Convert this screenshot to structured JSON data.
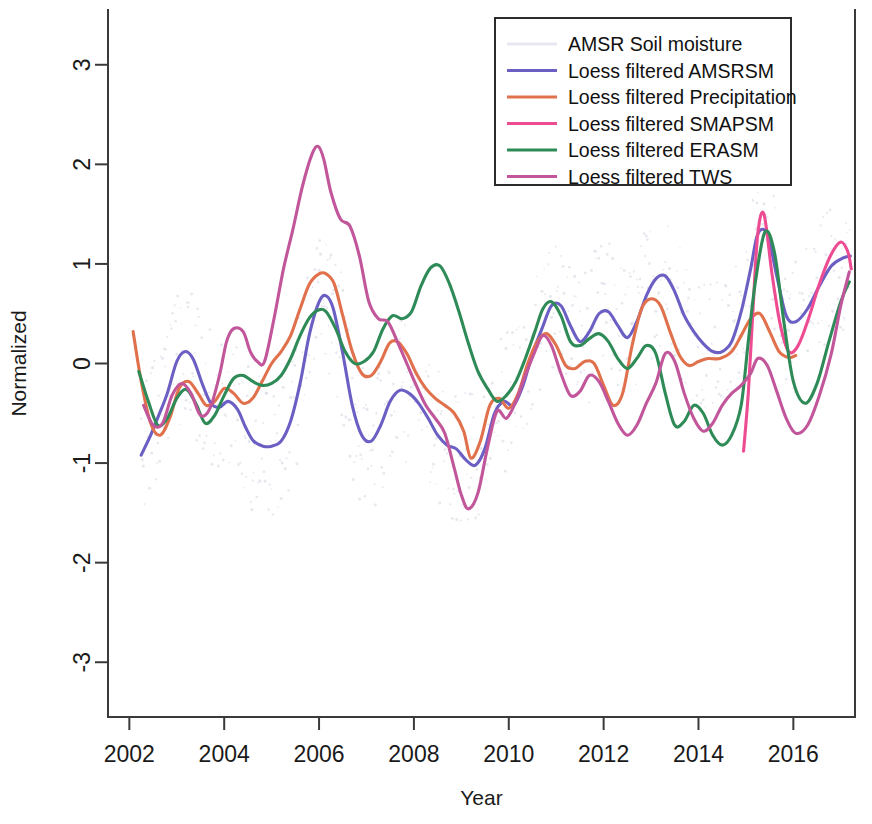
{
  "chart_data": {
    "type": "line",
    "title": "",
    "xlabel": "Year",
    "ylabel": "Normalized",
    "xlim": [
      2001.55,
      2017.3
    ],
    "ylim": [
      -3.55,
      3.55
    ],
    "xticks": [
      2002,
      2004,
      2006,
      2008,
      2010,
      2012,
      2014,
      2016
    ],
    "xticklabels": [
      "2002",
      "2004",
      "2006",
      "2008",
      "2010",
      "2012",
      "2014",
      "2016"
    ],
    "yticks": [
      -3,
      -2,
      -1,
      0,
      1,
      2,
      3
    ],
    "yticklabels": [
      "-3",
      "-2",
      "-1",
      "0",
      "1",
      "2",
      "3"
    ],
    "grid": false,
    "legend_position": "top-right",
    "legend": [
      {
        "label": "AMSR Soil moisture",
        "color": "#e8e8f2",
        "key": "amsr_raw"
      },
      {
        "label": "Loess filtered AMSRSM",
        "color": "#6b5fc4",
        "key": "amsrsm"
      },
      {
        "label": "Loess filtered Precipitation",
        "color": "#e0714c",
        "key": "precipitation"
      },
      {
        "label": "Loess filtered SMAPSM",
        "color": "#ee4c92",
        "key": "smapsm"
      },
      {
        "label": "Loess filtered ERASM",
        "color": "#2e8b57",
        "key": "erasm"
      },
      {
        "label": "Loess filtered TWS",
        "color": "#c2569b",
        "key": "tws"
      }
    ],
    "series": [
      {
        "name": "Loess filtered AMSRSM",
        "key": "amsrsm",
        "color": "#6b5fc4",
        "x": [
          2002.25,
          2002.45,
          2002.62,
          2002.8,
          2003.0,
          2003.18,
          2003.35,
          2003.55,
          2003.72,
          2003.9,
          2004.08,
          2004.28,
          2004.45,
          2004.62,
          2004.82,
          2005.0,
          2005.2,
          2005.4,
          2005.6,
          2005.8,
          2006.0,
          2006.15,
          2006.3,
          2006.5,
          2006.7,
          2006.9,
          2007.1,
          2007.3,
          2007.5,
          2007.7,
          2007.9,
          2008.1,
          2008.3,
          2008.5,
          2008.7,
          2008.9,
          2009.1,
          2009.3,
          2009.5,
          2009.7,
          2009.9,
          2010.1,
          2010.3,
          2010.5,
          2010.7,
          2010.9,
          2011.1,
          2011.3,
          2011.5,
          2011.7,
          2011.9,
          2012.1,
          2012.3,
          2012.5,
          2012.7,
          2012.9,
          2013.1,
          2013.3,
          2013.5,
          2013.7,
          2013.9,
          2014.1,
          2014.3,
          2014.5,
          2014.7,
          2014.9,
          2015.1,
          2015.25,
          2015.45,
          2015.65,
          2015.85,
          2016.05,
          2016.3,
          2016.55,
          2016.8,
          2017.05,
          2017.2
        ],
        "y": [
          -0.92,
          -0.72,
          -0.52,
          -0.3,
          0.02,
          0.12,
          0.04,
          -0.22,
          -0.4,
          -0.44,
          -0.38,
          -0.46,
          -0.64,
          -0.78,
          -0.83,
          -0.83,
          -0.78,
          -0.58,
          -0.2,
          0.3,
          0.62,
          0.68,
          0.55,
          0.1,
          -0.42,
          -0.72,
          -0.78,
          -0.62,
          -0.38,
          -0.27,
          -0.3,
          -0.4,
          -0.55,
          -0.72,
          -0.82,
          -0.86,
          -0.97,
          -1.02,
          -0.85,
          -0.5,
          -0.38,
          -0.42,
          -0.22,
          0.1,
          0.35,
          0.58,
          0.58,
          0.38,
          0.22,
          0.32,
          0.5,
          0.52,
          0.38,
          0.26,
          0.42,
          0.68,
          0.85,
          0.88,
          0.72,
          0.48,
          0.32,
          0.2,
          0.12,
          0.12,
          0.22,
          0.52,
          0.95,
          1.3,
          1.3,
          0.88,
          0.48,
          0.42,
          0.55,
          0.78,
          0.98,
          1.06,
          1.08
        ]
      },
      {
        "name": "Loess filtered Precipitation",
        "key": "precipitation",
        "color": "#e0714c",
        "x": [
          2002.08,
          2002.25,
          2002.45,
          2002.65,
          2002.85,
          2003.05,
          2003.25,
          2003.45,
          2003.62,
          2003.8,
          2004.0,
          2004.2,
          2004.4,
          2004.6,
          2004.8,
          2005.0,
          2005.2,
          2005.4,
          2005.6,
          2005.8,
          2006.0,
          2006.15,
          2006.32,
          2006.5,
          2006.7,
          2006.9,
          2007.1,
          2007.3,
          2007.48,
          2007.65,
          2007.85,
          2008.05,
          2008.25,
          2008.45,
          2008.65,
          2008.85,
          2009.05,
          2009.2,
          2009.4,
          2009.6,
          2009.8,
          2010.0,
          2010.2,
          2010.4,
          2010.6,
          2010.8,
          2011.0,
          2011.2,
          2011.4,
          2011.6,
          2011.8,
          2012.0,
          2012.2,
          2012.4,
          2012.6,
          2012.8,
          2013.0,
          2013.2,
          2013.4,
          2013.6,
          2013.8,
          2014.0,
          2014.2,
          2014.45,
          2014.7,
          2014.9,
          2015.1,
          2015.3,
          2015.5,
          2015.7,
          2015.9,
          2016.05
        ],
        "y": [
          0.32,
          -0.18,
          -0.6,
          -0.72,
          -0.55,
          -0.25,
          -0.18,
          -0.3,
          -0.42,
          -0.38,
          -0.25,
          -0.3,
          -0.4,
          -0.35,
          -0.18,
          0.0,
          0.12,
          0.28,
          0.55,
          0.8,
          0.9,
          0.9,
          0.8,
          0.48,
          0.12,
          -0.1,
          -0.12,
          0.02,
          0.2,
          0.22,
          0.1,
          -0.1,
          -0.25,
          -0.35,
          -0.42,
          -0.5,
          -0.68,
          -0.95,
          -0.78,
          -0.42,
          -0.35,
          -0.45,
          -0.3,
          0.0,
          0.22,
          0.3,
          0.18,
          -0.02,
          -0.05,
          0.02,
          0.0,
          -0.22,
          -0.42,
          -0.3,
          0.18,
          0.55,
          0.65,
          0.58,
          0.32,
          0.08,
          -0.02,
          0.02,
          0.05,
          0.05,
          0.12,
          0.28,
          0.45,
          0.5,
          0.32,
          0.12,
          0.06,
          0.08
        ]
      },
      {
        "name": "Loess filtered SMAPSM",
        "key": "smapsm",
        "color": "#ee4c92",
        "x": [
          2014.95,
          2015.05,
          2015.15,
          2015.25,
          2015.38,
          2015.55,
          2015.72,
          2015.9,
          2016.1,
          2016.32,
          2016.55,
          2016.78,
          2017.0,
          2017.15,
          2017.22
        ],
        "y": [
          -0.88,
          -0.3,
          0.55,
          1.3,
          1.5,
          0.9,
          0.4,
          0.12,
          0.18,
          0.45,
          0.8,
          1.08,
          1.22,
          1.12,
          0.95
        ]
      },
      {
        "name": "Loess filtered ERASM",
        "key": "erasm",
        "color": "#2e8b57",
        "x": [
          2002.2,
          2002.4,
          2002.6,
          2002.8,
          2003.0,
          2003.2,
          2003.4,
          2003.6,
          2003.8,
          2004.0,
          2004.2,
          2004.4,
          2004.6,
          2004.8,
          2005.0,
          2005.2,
          2005.4,
          2005.6,
          2005.8,
          2006.0,
          2006.15,
          2006.35,
          2006.55,
          2006.75,
          2006.95,
          2007.15,
          2007.35,
          2007.55,
          2007.75,
          2007.95,
          2008.15,
          2008.35,
          2008.55,
          2008.75,
          2008.95,
          2009.15,
          2009.35,
          2009.55,
          2009.75,
          2009.95,
          2010.15,
          2010.35,
          2010.55,
          2010.72,
          2010.9,
          2011.1,
          2011.3,
          2011.5,
          2011.7,
          2011.9,
          2012.1,
          2012.3,
          2012.5,
          2012.7,
          2012.9,
          2013.1,
          2013.3,
          2013.5,
          2013.7,
          2013.9,
          2014.1,
          2014.3,
          2014.5,
          2014.7,
          2014.9,
          2015.05,
          2015.2,
          2015.4,
          2015.6,
          2015.8,
          2016.0,
          2016.25,
          2016.5,
          2016.75,
          2017.0,
          2017.18
        ],
        "y": [
          -0.08,
          -0.38,
          -0.62,
          -0.55,
          -0.35,
          -0.26,
          -0.4,
          -0.6,
          -0.52,
          -0.32,
          -0.15,
          -0.12,
          -0.18,
          -0.22,
          -0.2,
          -0.12,
          0.05,
          0.28,
          0.46,
          0.54,
          0.52,
          0.35,
          0.12,
          0.0,
          0.02,
          0.12,
          0.35,
          0.48,
          0.45,
          0.52,
          0.78,
          0.96,
          0.98,
          0.8,
          0.52,
          0.2,
          -0.08,
          -0.25,
          -0.38,
          -0.32,
          -0.18,
          0.05,
          0.32,
          0.55,
          0.62,
          0.48,
          0.22,
          0.18,
          0.25,
          0.3,
          0.22,
          0.05,
          -0.05,
          0.05,
          0.18,
          0.1,
          -0.3,
          -0.62,
          -0.58,
          -0.42,
          -0.5,
          -0.72,
          -0.82,
          -0.72,
          -0.42,
          0.22,
          0.82,
          1.32,
          1.12,
          0.42,
          -0.18,
          -0.4,
          -0.2,
          0.22,
          0.62,
          0.82
        ]
      },
      {
        "name": "Loess filtered TWS",
        "key": "tws",
        "color": "#c2569b",
        "x": [
          2002.3,
          2002.5,
          2002.7,
          2002.9,
          2003.1,
          2003.3,
          2003.5,
          2003.7,
          2003.9,
          2004.05,
          2004.2,
          2004.4,
          2004.55,
          2004.7,
          2004.85,
          2005.05,
          2005.25,
          2005.45,
          2005.65,
          2005.85,
          2005.98,
          2006.1,
          2006.25,
          2006.45,
          2006.65,
          2006.85,
          2007.05,
          2007.25,
          2007.45,
          2007.65,
          2007.85,
          2008.05,
          2008.25,
          2008.45,
          2008.65,
          2008.85,
          2009.0,
          2009.15,
          2009.35,
          2009.55,
          2009.75,
          2009.95,
          2010.15,
          2010.35,
          2010.55,
          2010.72,
          2010.9,
          2011.1,
          2011.3,
          2011.5,
          2011.7,
          2011.9,
          2012.1,
          2012.3,
          2012.5,
          2012.7,
          2012.9,
          2013.1,
          2013.3,
          2013.5,
          2013.7,
          2013.9,
          2014.1,
          2014.3,
          2014.5,
          2014.7,
          2014.9,
          2015.1,
          2015.25,
          2015.45,
          2015.65,
          2015.85,
          2016.05,
          2016.3,
          2016.55,
          2016.8,
          2017.0,
          2017.18
        ],
        "y": [
          -0.42,
          -0.62,
          -0.6,
          -0.32,
          -0.2,
          -0.3,
          -0.52,
          -0.45,
          -0.12,
          0.22,
          0.35,
          0.32,
          0.12,
          0.02,
          0.02,
          0.45,
          0.95,
          1.35,
          1.78,
          2.1,
          2.18,
          2.05,
          1.72,
          1.45,
          1.38,
          1.08,
          0.62,
          0.45,
          0.42,
          0.22,
          0.0,
          -0.22,
          -0.42,
          -0.55,
          -0.7,
          -1.05,
          -1.32,
          -1.46,
          -1.3,
          -0.85,
          -0.48,
          -0.55,
          -0.38,
          -0.12,
          0.12,
          0.28,
          0.18,
          -0.1,
          -0.32,
          -0.28,
          -0.12,
          -0.18,
          -0.38,
          -0.6,
          -0.72,
          -0.62,
          -0.4,
          -0.2,
          0.1,
          0.02,
          -0.3,
          -0.55,
          -0.68,
          -0.6,
          -0.42,
          -0.3,
          -0.22,
          -0.1,
          0.05,
          -0.02,
          -0.28,
          -0.55,
          -0.7,
          -0.62,
          -0.32,
          0.1,
          0.58,
          0.92
        ]
      }
    ],
    "raw_scatter_note": "AMSR Soil moisture raw points shown as very faint light-gray jitter"
  }
}
